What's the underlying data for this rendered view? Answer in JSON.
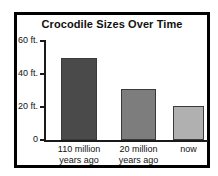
{
  "chart_data": {
    "type": "bar",
    "title": "Crocodile Sizes Over Time",
    "xlabel": "",
    "ylabel": "",
    "ylim": [
      0,
      60
    ],
    "yticks": [
      0,
      20,
      40,
      60
    ],
    "ytick_labels": [
      "0",
      "20 ft.",
      "40 ft.",
      "60 ft."
    ],
    "grid": false,
    "legend": "none",
    "units": "ft.",
    "categories": [
      "110 million years ago",
      "20 million years ago",
      "now"
    ],
    "category_lines": [
      {
        "line1": "110 million",
        "line2": "years ago"
      },
      {
        "line1": "20 million",
        "line2": "years ago"
      },
      {
        "line1": "now",
        "line2": ""
      }
    ],
    "values": [
      50,
      31,
      20.5
    ],
    "bar_colors": [
      "#4a4a4a",
      "#7d7d7d",
      "#b0b0b0"
    ]
  },
  "frame": {
    "border_color": "#000000"
  }
}
